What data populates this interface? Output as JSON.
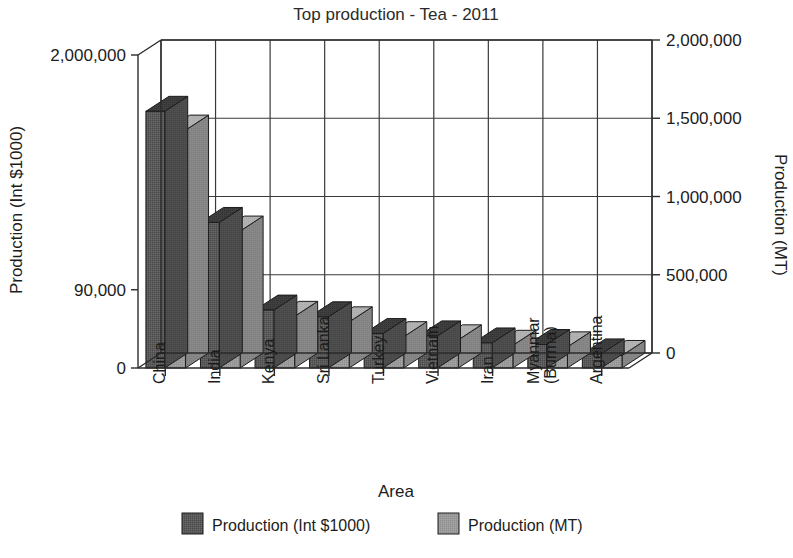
{
  "chart_data": {
    "type": "bar",
    "title": "Top production - Tea - 2011",
    "xlabel": "Area",
    "ylabel": "Production (Int $1000)",
    "y2label": "Production (MT)",
    "categories": [
      "China",
      "India",
      "Kenya",
      "Sri Lanka",
      "Turkey",
      "Vietnam",
      "Iran",
      "Myanmar (Burma)",
      "Argentina"
    ],
    "category_lines": [
      [
        "China"
      ],
      [
        "India"
      ],
      [
        "Kenya"
      ],
      [
        "Sri Lanka"
      ],
      [
        "Turkey"
      ],
      [
        "Vietnam"
      ],
      [
        "Iran"
      ],
      [
        "Myanmar",
        "(Burma)"
      ],
      [
        "Argentina"
      ]
    ],
    "series": [
      {
        "name": "Production (Int $1000)",
        "color": "#595959",
        "values": [
          1640000,
          930000,
          370000,
          327000,
          220000,
          205000,
          160000,
          150000,
          90000
        ]
      },
      {
        "name": "Production (MT)",
        "color": "#9a9a9a",
        "values": [
          1520000,
          875000,
          330000,
          295000,
          200000,
          180000,
          145000,
          135000,
          80000
        ]
      }
    ],
    "y_ticks_left": [
      "0",
      "90,000",
      "2,000,000"
    ],
    "y_ticks_left_values": [
      0,
      500000,
      2000000
    ],
    "y_ticks_right": [
      "0",
      "500,000",
      "1,000,000",
      "1,500,000",
      "2,000,000"
    ],
    "y_ticks_right_values": [
      0,
      500000,
      1000000,
      1500000,
      2000000
    ],
    "ylim": [
      0,
      2000000
    ],
    "grid": true,
    "legend_position": "bottom",
    "projection": "3d"
  },
  "legend": {
    "items": [
      {
        "label": "Production (Int $1000)",
        "swatch": "#595959"
      },
      {
        "label": "Production (MT)",
        "swatch": "#9a9a9a"
      }
    ]
  }
}
